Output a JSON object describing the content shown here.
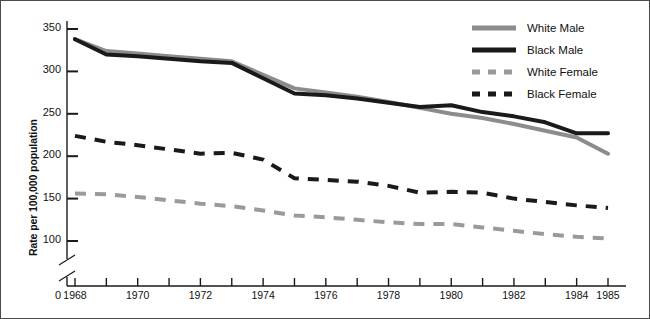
{
  "chart_data": {
    "type": "line",
    "title": "",
    "xlabel": "",
    "ylabel": "Rate per 100,000 population",
    "x": [
      1968,
      1969,
      1970,
      1971,
      1972,
      1973,
      1974,
      1975,
      1976,
      1977,
      1978,
      1979,
      1980,
      1981,
      1982,
      1983,
      1984,
      1985
    ],
    "xlim": [
      1968,
      1985
    ],
    "ylim": [
      100,
      350
    ],
    "y_axis_break": true,
    "y_origin_label": "0",
    "x_origin_label": "0",
    "grid": false,
    "legend_position": "top-right",
    "xticks": [
      1968,
      1969,
      1970,
      1971,
      1972,
      1973,
      1974,
      1975,
      1976,
      1977,
      1978,
      1979,
      1980,
      1981,
      1982,
      1983,
      1984,
      1985
    ],
    "xtick_labels": [
      "1968",
      "",
      "1970",
      "",
      "1972",
      "",
      "1974",
      "",
      "1976",
      "",
      "1978",
      "",
      "1980",
      "",
      "1982",
      "",
      "1984",
      "1985"
    ],
    "yticks": [
      100,
      150,
      200,
      250,
      300,
      350
    ],
    "ytick_labels": [
      "100",
      "150",
      "200",
      "250",
      "300",
      "350"
    ],
    "series": [
      {
        "name": "White Male",
        "color": "#8c8c8c",
        "style": "solid",
        "width": 4,
        "values": [
          338,
          324,
          321,
          318,
          315,
          312,
          296,
          280,
          275,
          270,
          264,
          257,
          250,
          245,
          238,
          230,
          222,
          203
        ]
      },
      {
        "name": "Black Male",
        "color": "#1a1a1a",
        "style": "solid",
        "width": 4,
        "values": [
          338,
          320,
          318,
          315,
          312,
          310,
          292,
          274,
          272,
          268,
          263,
          258,
          260,
          252,
          247,
          240,
          227,
          227
        ]
      },
      {
        "name": "White Female",
        "color": "#9a9a9a",
        "style": "dashed",
        "width": 4,
        "values": [
          156,
          155,
          152,
          148,
          144,
          141,
          136,
          130,
          128,
          125,
          122,
          120,
          120,
          116,
          112,
          108,
          105,
          103
        ]
      },
      {
        "name": "Black Female",
        "color": "#1a1a1a",
        "style": "dashed",
        "width": 4,
        "values": [
          224,
          217,
          213,
          208,
          203,
          204,
          196,
          174,
          172,
          170,
          165,
          157,
          158,
          157,
          150,
          146,
          142,
          139
        ]
      }
    ]
  },
  "legend": {
    "items": [
      {
        "label": "White Male"
      },
      {
        "label": "Black Male"
      },
      {
        "label": "White Female"
      },
      {
        "label": "Black Female"
      }
    ]
  }
}
